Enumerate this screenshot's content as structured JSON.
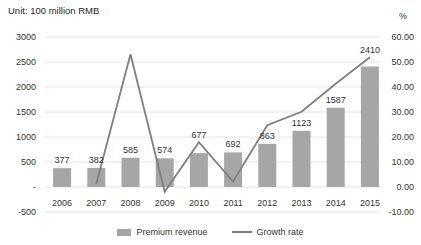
{
  "title": "Unit: 100 million RMB",
  "right_axis_unit": "%",
  "legend": {
    "premium": "Premium revenue",
    "growth": "Growth rate"
  },
  "colors": {
    "bar": "#a6a6a6",
    "line": "#7f7f7f",
    "text": "#333333",
    "grid": "#e4e4e4",
    "background": "#ffffff"
  },
  "left_axis_ticks": [
    "3000",
    "2500",
    "2000",
    "1500",
    "1000",
    "500",
    "-",
    "-500"
  ],
  "right_axis_ticks": [
    "60.00",
    "50.00",
    "40.00",
    "30.00",
    "20.00",
    "10.00",
    "0.00",
    "-10.00"
  ],
  "chart_data": {
    "type": "bar+line",
    "categories": [
      "2006",
      "2007",
      "2008",
      "2009",
      "2010",
      "2011",
      "2012",
      "2013",
      "2014",
      "2015"
    ],
    "series": [
      {
        "name": "Premium revenue",
        "type": "bar",
        "axis": "left",
        "values": [
          377,
          382,
          585,
          574,
          677,
          692,
          863,
          1123,
          1587,
          2410
        ],
        "labels_shown": true
      },
      {
        "name": "Growth rate",
        "type": "line",
        "axis": "right",
        "values": [
          null,
          1.3,
          53.1,
          -1.9,
          17.9,
          2.2,
          24.7,
          30.1,
          41.3,
          51.9
        ],
        "labels_shown": false
      }
    ],
    "title": "Unit: 100 million RMB",
    "xlabel": "",
    "ylabel_left": "100 million RMB",
    "ylabel_right": "%",
    "left_ylim": [
      -500,
      3000
    ],
    "right_ylim": [
      -10,
      60
    ],
    "grid": true,
    "legend_position": "bottom"
  }
}
